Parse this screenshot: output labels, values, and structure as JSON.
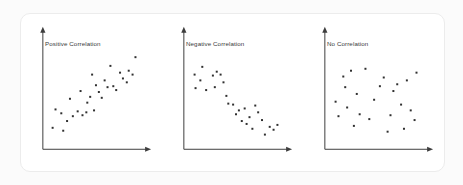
{
  "page": {
    "background_color": "#fbfbfb",
    "card_background_color": "#ffffff",
    "card_border_color": "#ececec"
  },
  "style": {
    "axis_color": "#3d3d3d",
    "dot_color": "#2f2f2f",
    "title_color": "#3a3a3a",
    "dot_size_px": 2
  },
  "chart_data": [
    {
      "type": "scatter",
      "title": "Positive Correlation",
      "xlabel": "",
      "ylabel": "",
      "xlim": [
        0,
        100
      ],
      "ylim": [
        0,
        100
      ],
      "grid": false,
      "legend": "none",
      "points": [
        {
          "x": 5,
          "y": 13
        },
        {
          "x": 8,
          "y": 32
        },
        {
          "x": 14,
          "y": 28
        },
        {
          "x": 16,
          "y": 10
        },
        {
          "x": 20,
          "y": 20
        },
        {
          "x": 23,
          "y": 43
        },
        {
          "x": 26,
          "y": 25
        },
        {
          "x": 31,
          "y": 30
        },
        {
          "x": 34,
          "y": 51
        },
        {
          "x": 36,
          "y": 26
        },
        {
          "x": 40,
          "y": 29
        },
        {
          "x": 41,
          "y": 39
        },
        {
          "x": 44,
          "y": 45
        },
        {
          "x": 46,
          "y": 68
        },
        {
          "x": 48,
          "y": 31
        },
        {
          "x": 50,
          "y": 57
        },
        {
          "x": 53,
          "y": 50
        },
        {
          "x": 56,
          "y": 44
        },
        {
          "x": 59,
          "y": 62
        },
        {
          "x": 62,
          "y": 55
        },
        {
          "x": 65,
          "y": 77
        },
        {
          "x": 68,
          "y": 56
        },
        {
          "x": 71,
          "y": 52
        },
        {
          "x": 75,
          "y": 70
        },
        {
          "x": 78,
          "y": 64
        },
        {
          "x": 82,
          "y": 60
        },
        {
          "x": 84,
          "y": 72
        },
        {
          "x": 88,
          "y": 68
        },
        {
          "x": 91,
          "y": 86
        }
      ]
    },
    {
      "type": "scatter",
      "title": "Negative Correlation",
      "xlabel": "",
      "ylabel": "",
      "xlim": [
        0,
        100
      ],
      "ylim": [
        0,
        100
      ],
      "grid": false,
      "legend": "none",
      "points": [
        {
          "x": 6,
          "y": 68
        },
        {
          "x": 7,
          "y": 54
        },
        {
          "x": 12,
          "y": 62
        },
        {
          "x": 14,
          "y": 76
        },
        {
          "x": 18,
          "y": 52
        },
        {
          "x": 25,
          "y": 67
        },
        {
          "x": 27,
          "y": 55
        },
        {
          "x": 29,
          "y": 71
        },
        {
          "x": 33,
          "y": 68
        },
        {
          "x": 36,
          "y": 60
        },
        {
          "x": 39,
          "y": 46
        },
        {
          "x": 41,
          "y": 38
        },
        {
          "x": 46,
          "y": 37
        },
        {
          "x": 49,
          "y": 27
        },
        {
          "x": 52,
          "y": 31
        },
        {
          "x": 55,
          "y": 20
        },
        {
          "x": 58,
          "y": 33
        },
        {
          "x": 60,
          "y": 17
        },
        {
          "x": 63,
          "y": 24
        },
        {
          "x": 66,
          "y": 12
        },
        {
          "x": 69,
          "y": 36
        },
        {
          "x": 72,
          "y": 29
        },
        {
          "x": 76,
          "y": 21
        },
        {
          "x": 79,
          "y": 6
        },
        {
          "x": 84,
          "y": 14
        },
        {
          "x": 88,
          "y": 11
        },
        {
          "x": 92,
          "y": 16
        }
      ]
    },
    {
      "type": "scatter",
      "title": "No Correlation",
      "xlabel": "",
      "ylabel": "",
      "xlim": [
        0,
        100
      ],
      "ylim": [
        0,
        100
      ],
      "grid": false,
      "legend": "none",
      "points": [
        {
          "x": 6,
          "y": 40
        },
        {
          "x": 9,
          "y": 25
        },
        {
          "x": 14,
          "y": 66
        },
        {
          "x": 16,
          "y": 55
        },
        {
          "x": 18,
          "y": 34
        },
        {
          "x": 22,
          "y": 72
        },
        {
          "x": 25,
          "y": 15
        },
        {
          "x": 28,
          "y": 48
        },
        {
          "x": 31,
          "y": 27
        },
        {
          "x": 37,
          "y": 74
        },
        {
          "x": 41,
          "y": 22
        },
        {
          "x": 46,
          "y": 42
        },
        {
          "x": 52,
          "y": 56
        },
        {
          "x": 56,
          "y": 65
        },
        {
          "x": 60,
          "y": 9
        },
        {
          "x": 63,
          "y": 26
        },
        {
          "x": 66,
          "y": 51
        },
        {
          "x": 70,
          "y": 58
        },
        {
          "x": 74,
          "y": 37
        },
        {
          "x": 77,
          "y": 12
        },
        {
          "x": 80,
          "y": 62
        },
        {
          "x": 84,
          "y": 31
        },
        {
          "x": 88,
          "y": 21
        },
        {
          "x": 90,
          "y": 70
        }
      ]
    }
  ]
}
